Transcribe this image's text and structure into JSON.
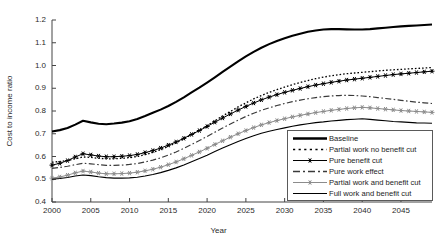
{
  "chart_data": {
    "type": "line",
    "title": "",
    "xlabel": "Year",
    "ylabel": "Cost to income ratio",
    "xlim": [
      2000,
      2049
    ],
    "ylim": [
      0.4,
      1.2
    ],
    "grid": false,
    "legend_position": "bottom-right",
    "x_ticks": [
      "2000",
      "2005",
      "2010",
      "2015",
      "2020",
      "2025",
      "2030",
      "2035",
      "2040",
      "2045"
    ],
    "x_tick_values": [
      2000,
      2005,
      2010,
      2015,
      2020,
      2025,
      2030,
      2035,
      2040,
      2045
    ],
    "y_ticks": [
      "0.4",
      "0.5",
      "0.6",
      "0.7",
      "0.8",
      "0.9",
      "1.0",
      "1.1",
      "1.2"
    ],
    "y_tick_values": [
      0.4,
      0.5,
      0.6,
      0.7,
      0.8,
      0.9,
      1.0,
      1.1,
      1.2
    ],
    "x": [
      2000,
      2001,
      2002,
      2003,
      2004,
      2005,
      2006,
      2007,
      2008,
      2009,
      2010,
      2011,
      2012,
      2013,
      2014,
      2015,
      2016,
      2017,
      2018,
      2019,
      2020,
      2021,
      2022,
      2023,
      2024,
      2025,
      2026,
      2027,
      2028,
      2029,
      2030,
      2031,
      2032,
      2033,
      2034,
      2035,
      2036,
      2037,
      2038,
      2039,
      2040,
      2041,
      2042,
      2043,
      2044,
      2045,
      2046,
      2047,
      2048,
      2049
    ],
    "series": [
      {
        "name": "Baseline",
        "style": "solid-thick",
        "color": "#000000",
        "marker": "none",
        "values": [
          0.71,
          0.716,
          0.725,
          0.74,
          0.757,
          0.75,
          0.744,
          0.742,
          0.745,
          0.749,
          0.755,
          0.765,
          0.778,
          0.792,
          0.806,
          0.822,
          0.84,
          0.86,
          0.882,
          0.903,
          0.925,
          0.948,
          0.972,
          0.995,
          1.018,
          1.04,
          1.06,
          1.078,
          1.094,
          1.108,
          1.12,
          1.131,
          1.14,
          1.148,
          1.154,
          1.158,
          1.16,
          1.16,
          1.159,
          1.158,
          1.158,
          1.16,
          1.163,
          1.166,
          1.169,
          1.172,
          1.174,
          1.176,
          1.178,
          1.18
        ]
      },
      {
        "name": "Partial work no benefit cut",
        "style": "dotted",
        "color": "#000000",
        "marker": "none",
        "values": [
          0.575,
          0.578,
          0.582,
          0.59,
          0.598,
          0.596,
          0.592,
          0.59,
          0.59,
          0.592,
          0.595,
          0.6,
          0.608,
          0.618,
          0.63,
          0.644,
          0.66,
          0.678,
          0.697,
          0.716,
          0.736,
          0.757,
          0.778,
          0.798,
          0.818,
          0.836,
          0.853,
          0.868,
          0.882,
          0.894,
          0.905,
          0.916,
          0.925,
          0.934,
          0.942,
          0.949,
          0.955,
          0.96,
          0.964,
          0.967,
          0.97,
          0.973,
          0.976,
          0.979,
          0.981,
          0.983,
          0.985,
          0.987,
          0.989,
          0.991
        ]
      },
      {
        "name": "Pure benefit cut",
        "style": "solid-marker",
        "color": "#000000",
        "marker": "asterisk",
        "values": [
          0.562,
          0.57,
          0.582,
          0.598,
          0.612,
          0.607,
          0.602,
          0.599,
          0.599,
          0.601,
          0.604,
          0.609,
          0.617,
          0.626,
          0.637,
          0.65,
          0.664,
          0.68,
          0.697,
          0.714,
          0.732,
          0.751,
          0.769,
          0.787,
          0.804,
          0.82,
          0.835,
          0.849,
          0.861,
          0.872,
          0.882,
          0.891,
          0.899,
          0.907,
          0.914,
          0.92,
          0.926,
          0.931,
          0.936,
          0.94,
          0.944,
          0.948,
          0.952,
          0.956,
          0.96,
          0.963,
          0.966,
          0.969,
          0.972,
          0.975
        ]
      },
      {
        "name": "Pure work effect",
        "style": "dash-dot",
        "color": "#3a3a3a",
        "marker": "none",
        "values": [
          0.548,
          0.552,
          0.557,
          0.564,
          0.57,
          0.568,
          0.564,
          0.561,
          0.561,
          0.562,
          0.565,
          0.569,
          0.576,
          0.584,
          0.594,
          0.606,
          0.62,
          0.636,
          0.653,
          0.67,
          0.688,
          0.707,
          0.725,
          0.743,
          0.76,
          0.776,
          0.79,
          0.803,
          0.814,
          0.824,
          0.833,
          0.841,
          0.848,
          0.854,
          0.859,
          0.863,
          0.866,
          0.868,
          0.869,
          0.868,
          0.866,
          0.863,
          0.859,
          0.855,
          0.851,
          0.847,
          0.843,
          0.839,
          0.836,
          0.833
        ]
      },
      {
        "name": "Partial work and benefit cut",
        "style": "solid-marker-gray",
        "color": "#8c8c8c",
        "marker": "star",
        "values": [
          0.505,
          0.51,
          0.518,
          0.528,
          0.536,
          0.532,
          0.527,
          0.524,
          0.524,
          0.525,
          0.527,
          0.531,
          0.537,
          0.544,
          0.553,
          0.564,
          0.576,
          0.59,
          0.605,
          0.62,
          0.636,
          0.653,
          0.669,
          0.685,
          0.7,
          0.714,
          0.727,
          0.739,
          0.749,
          0.758,
          0.766,
          0.774,
          0.781,
          0.787,
          0.793,
          0.798,
          0.803,
          0.807,
          0.811,
          0.814,
          0.816,
          0.814,
          0.811,
          0.808,
          0.805,
          0.802,
          0.8,
          0.798,
          0.796,
          0.794
        ]
      },
      {
        "name": "Full work and benefit cut",
        "style": "solid-thin",
        "color": "#000000",
        "marker": "none",
        "values": [
          0.5,
          0.503,
          0.508,
          0.514,
          0.519,
          0.516,
          0.511,
          0.507,
          0.505,
          0.505,
          0.506,
          0.509,
          0.514,
          0.521,
          0.529,
          0.539,
          0.55,
          0.563,
          0.577,
          0.591,
          0.606,
          0.622,
          0.637,
          0.652,
          0.666,
          0.679,
          0.691,
          0.702,
          0.711,
          0.719,
          0.726,
          0.733,
          0.739,
          0.744,
          0.749,
          0.752,
          0.756,
          0.759,
          0.762,
          0.764,
          0.766,
          0.763,
          0.76,
          0.757,
          0.754,
          0.752,
          0.75,
          0.748,
          0.747,
          0.746
        ]
      }
    ]
  },
  "legend": {
    "items": [
      {
        "label": "Baseline",
        "sample": "solid-thick"
      },
      {
        "label": "Partial work no benefit cut",
        "sample": "dotted"
      },
      {
        "label": "Pure benefit cut",
        "sample": "solid-asterisk"
      },
      {
        "label": "Pure work effect",
        "sample": "dash-dot"
      },
      {
        "label": "Partial work and benefit cut",
        "sample": "solid-star-gray"
      },
      {
        "label": "Full work and benefit cut",
        "sample": "solid-thin"
      }
    ]
  },
  "axes": {
    "xlabel": "Year",
    "ylabel": "Cost to income ratio"
  }
}
